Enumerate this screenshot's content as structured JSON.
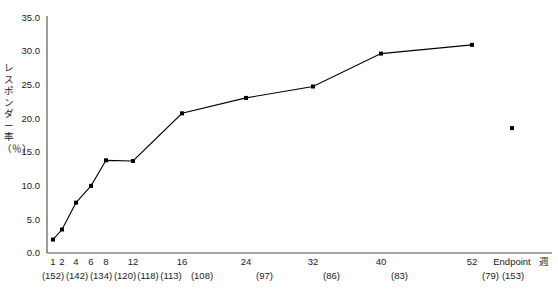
{
  "chart_data": {
    "type": "line",
    "title": "",
    "xlabel": "週",
    "ylabel": "レスポンダー率（％）",
    "ylim": [
      0.0,
      35.0
    ],
    "ytick_labels": [
      "35.0",
      "30.0",
      "25.0",
      "20.0",
      "15.0",
      "10.0",
      "5.0",
      "0.0"
    ],
    "ytick_values": [
      35.0,
      30.0,
      25.0,
      20.0,
      15.0,
      10.0,
      5.0,
      0.0
    ],
    "grid": false,
    "legend": "none",
    "categories": [
      "1",
      "2",
      "4",
      "6",
      "8",
      "12",
      "16",
      "24",
      "32",
      "40",
      "52",
      "Endpoint"
    ],
    "n_labels": [
      "(152)",
      "(142)",
      "(134)",
      "(120)",
      "(118)",
      "(113)",
      "(108)",
      "(97)",
      "(86)",
      "(83)",
      "(79)",
      "(153)"
    ],
    "n_values": [
      152,
      142,
      134,
      120,
      118,
      113,
      108,
      97,
      86,
      83,
      79,
      153
    ],
    "series": [
      {
        "name": "レスポンダー率",
        "values": [
          2.0,
          3.5,
          7.5,
          10.0,
          13.8,
          13.7,
          20.8,
          23.1,
          24.8,
          29.7,
          31.0,
          18.6
        ],
        "connected_through_index": 10,
        "marker": "filled-square",
        "color": "#000000",
        "line_color": "#000000"
      }
    ],
    "x_pixel_positions": [
      53,
      62,
      76,
      91,
      106,
      133,
      182,
      246,
      313,
      381,
      472,
      512
    ],
    "axis_color": "#4a4a4a"
  }
}
